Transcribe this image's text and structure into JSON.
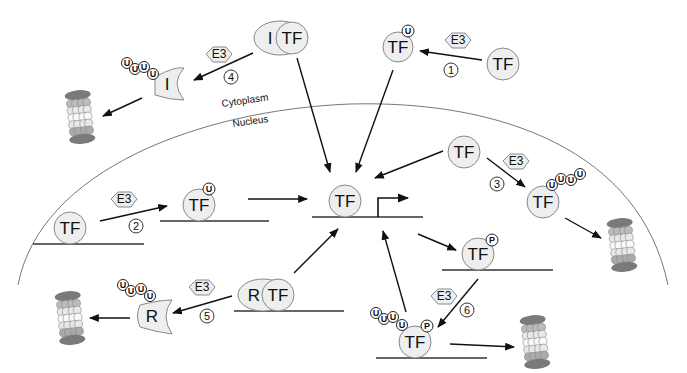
{
  "compartments": {
    "cytoplasm_label": "Cytoplasm",
    "nucleus_label": "Nucleus"
  },
  "molecules": {
    "tf": "TF",
    "inhibitor": "I",
    "repressor": "R",
    "e3": "E3",
    "ubiquitin": "U",
    "phosphate": "P"
  },
  "pathways": [
    {
      "id": "1",
      "label": "1",
      "description": "Cytoplasmic TF mono-ubiquitinated by E3, then enters nucleus"
    },
    {
      "id": "2",
      "label": "2",
      "description": "DNA-bound TF mono-ubiquitinated by E3 to activate transcription"
    },
    {
      "id": "3",
      "label": "3",
      "description": "Nuclear TF poly-ubiquitinated by E3 and degraded by proteasome"
    },
    {
      "id": "4",
      "label": "4",
      "description": "Inhibitor I poly-ubiquitinated by E3 and degraded, releasing TF"
    },
    {
      "id": "5",
      "label": "5",
      "description": "Repressor R poly-ubiquitinated by E3 and degraded, releasing TF"
    },
    {
      "id": "6",
      "label": "6",
      "description": "Phosphorylated TF poly-ubiquitinated by E3, degraded by proteasome"
    }
  ],
  "colors": {
    "molecule_fill": "#eeeeee",
    "molecule_stroke": "#888888",
    "line": "#111111",
    "membrane": "#777777",
    "proteasome_dark": "#777777",
    "proteasome_mid": "#aaaaaa",
    "proteasome_light": "#f4f4f4"
  }
}
